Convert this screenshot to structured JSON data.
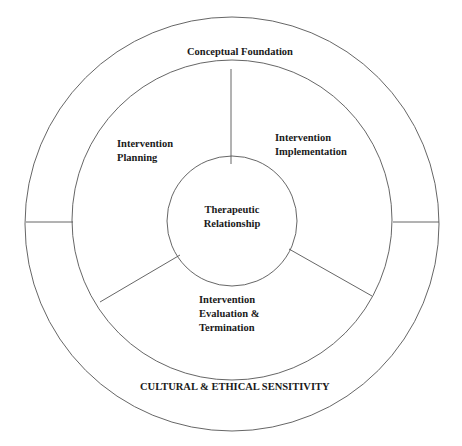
{
  "diagram": {
    "outer_ring": {
      "top_label": "Conceptual Foundation",
      "bottom_label": "CULTURAL & ETHICAL SENSITIVITY"
    },
    "segments": [
      {
        "line1": "Intervention",
        "line2": "Planning"
      },
      {
        "line1": "Intervention",
        "line2": "Implementation"
      },
      {
        "line1": "Intervention",
        "line2": "Evaluation &",
        "line3": "Termination"
      }
    ],
    "center": {
      "line1": "Therapeutic",
      "line2": "Relationship"
    },
    "colors": {
      "stroke": "#555555",
      "text": "#1a1a1a",
      "background": "#ffffff"
    }
  }
}
